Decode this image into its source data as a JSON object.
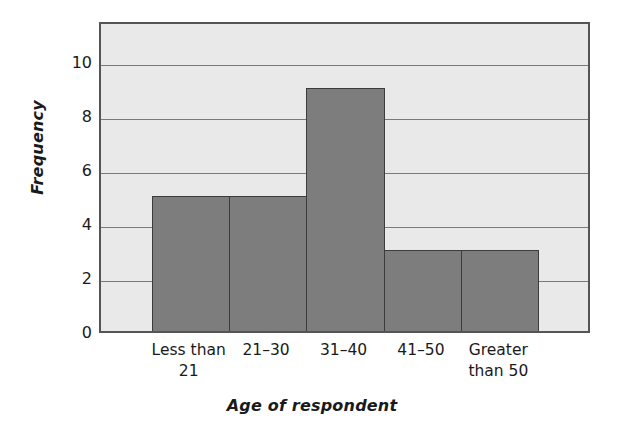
{
  "chart_data": {
    "type": "bar",
    "title": "",
    "subtitle": "",
    "categories": [
      "Less than 21",
      "21–30",
      "31–40",
      "41–50",
      "Greater than 50"
    ],
    "category_lines": [
      [
        "Less than",
        "21"
      ],
      [
        "21–30"
      ],
      [
        "31–40"
      ],
      [
        "41–50"
      ],
      [
        "Greater",
        "than 50"
      ]
    ],
    "values": [
      5,
      5,
      9,
      3,
      3
    ],
    "xlabel": "Age of respondent",
    "ylabel": "Frequency",
    "ylim": [
      0,
      11.5
    ],
    "yticks": [
      0,
      2,
      4,
      6,
      8,
      10
    ],
    "ytick_labels": [
      "0",
      "2",
      "4",
      "6",
      "8",
      "10"
    ],
    "grid": true,
    "grid_axis": "y",
    "legend": false,
    "legend_position": "none",
    "bar_gap": 0,
    "colors": {
      "bar_fill": "#7d7d7d",
      "bar_edge": "#3c3c3c",
      "plot_background": "#e9e9e9",
      "gridline": "#7a7a7a",
      "axis_frame": "#555555",
      "text": "#1a1a1a",
      "page_background": "#ffffff"
    }
  }
}
